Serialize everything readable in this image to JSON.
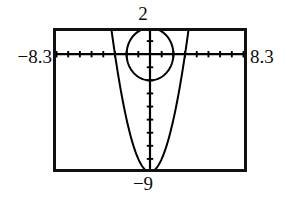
{
  "figure": {
    "kind": "graphing-calculator-viewport"
  },
  "labels": {
    "ymax": "2",
    "ymin": "−9",
    "xmin": "−8.3",
    "xmax": "8.3"
  },
  "colors": {
    "frame": "#111111",
    "curve": "#000000",
    "axis": "#000000",
    "background": "#ffffff"
  },
  "chart_data": {
    "type": "line",
    "title": "",
    "xlabel": "",
    "ylabel": "",
    "xlim": [
      -8.3,
      8.3
    ],
    "ylim": [
      -9,
      2
    ],
    "grid": false,
    "legend": "none",
    "axes": {
      "x_axis_y": 0,
      "y_axis_x": 0,
      "x_tick_step": 1,
      "y_tick_step": 1,
      "tick_marks": true
    },
    "tick_labels": {
      "x": [
        "-8.3",
        "8.3"
      ],
      "y": [
        "-9",
        "2"
      ]
    },
    "series": [
      {
        "name": "circle",
        "type": "implicit-circle",
        "center": [
          0,
          0
        ],
        "radius": 2,
        "style": "solid"
      },
      {
        "name": "parabola",
        "type": "quadratic",
        "equation": "y = x^2 - 9",
        "vertex": [
          0,
          -9
        ],
        "a": 1,
        "x": [
          -3.4,
          -3.0,
          -2.5,
          -2.0,
          -1.5,
          -1.0,
          -0.5,
          0,
          0.5,
          1.0,
          1.5,
          2.0,
          2.5,
          3.0,
          3.4
        ],
        "values": [
          2.56,
          0,
          -2.75,
          -5,
          -6.75,
          -8,
          -8.75,
          -9,
          -8.75,
          -8,
          -6.75,
          -5,
          -2.75,
          0,
          2.56
        ],
        "style": "solid"
      }
    ],
    "annotations": [
      {
        "text": "2",
        "position": "top-center",
        "meaning": "Ymax"
      },
      {
        "text": "-9",
        "position": "bottom-center",
        "meaning": "Ymin"
      },
      {
        "text": "-8.3",
        "position": "left-middle",
        "meaning": "Xmin"
      },
      {
        "text": "8.3",
        "position": "right-middle",
        "meaning": "Xmax"
      }
    ]
  }
}
